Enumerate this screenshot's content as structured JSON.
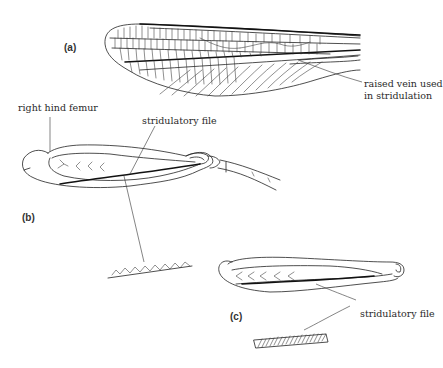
{
  "figure": {
    "panels": [
      {
        "id": "a",
        "label": "(a)",
        "subject": "forewing",
        "annotations": [
          {
            "text_line1": "raised vein used",
            "text_line2": "in stridulation"
          }
        ]
      },
      {
        "id": "b",
        "label": "(b)",
        "subject": "right hind femur",
        "annotations": [
          {
            "text": "right hind femur"
          },
          {
            "text": "stridulatory file"
          }
        ]
      },
      {
        "id": "c",
        "label": "(c)",
        "subject": "hind femur",
        "annotations": [
          {
            "text": "stridulatory file"
          }
        ]
      }
    ],
    "colors": {
      "ink": "#222222",
      "background": "#ffffff"
    }
  }
}
